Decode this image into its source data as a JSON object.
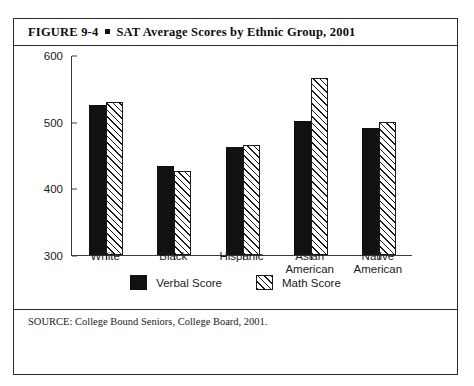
{
  "figure": {
    "number": "FIGURE  9-4",
    "title": "SAT Average Scores by Ethnic Group, 2001",
    "source": "SOURCE: College Bound Seniors, College Board, 2001."
  },
  "legend": {
    "verbal_label": "Verbal Score",
    "math_label": "Math Score"
  },
  "axis": {
    "ticks": [
      "600",
      "500",
      "400",
      "300"
    ]
  },
  "chart_data": {
    "type": "bar",
    "title": "SAT Average Scores by Ethnic Group, 2001",
    "xlabel": "",
    "ylabel": "",
    "ylim": [
      300,
      600
    ],
    "yticks": [
      300,
      400,
      500,
      600
    ],
    "grid": false,
    "legend_position": "bottom-center",
    "categories": [
      "White",
      "Black",
      "Hispanic",
      "Asian American",
      "Native American"
    ],
    "category_lines": [
      [
        "White"
      ],
      [
        "Black"
      ],
      [
        "Hispanic"
      ],
      [
        "Asian",
        "American"
      ],
      [
        "Native",
        "American"
      ]
    ],
    "series": [
      {
        "name": "Verbal Score",
        "fill": "solid-black",
        "values": [
          525,
          433,
          462,
          501,
          490
        ]
      },
      {
        "name": "Math Score",
        "fill": "diagonal-hatch",
        "values": [
          530,
          426,
          465,
          566,
          499
        ]
      }
    ]
  },
  "colors": {
    "verbal": "#111111",
    "math_hatch": "#1a1a1a",
    "frame": "#2b2b2b",
    "background": "#ffffff"
  }
}
